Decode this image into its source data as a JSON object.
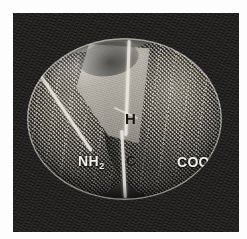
{
  "figure": {
    "kind": "space-filling-molecular-model",
    "background_color": "#201f1e",
    "page_margin_color": "#fdfdfd"
  },
  "labels": {
    "hydrogen": "H",
    "carbon": "C",
    "amino_group": "NH",
    "amino_group_subscript": "2",
    "carboxyl_group": "COOH"
  },
  "regions": {
    "amino_lobe_name": "amino-group-lobe",
    "carboxyl_lobe_name": "carboxyl-group-lobe",
    "hydrogen_wedge_name": "hydrogen-wedge"
  },
  "colors": {
    "plate": "#201f1e",
    "model_light": "#cdc9c1",
    "model_mid": "#8e8a83",
    "model_dark": "#3a3835",
    "ridge": "#ece8e0",
    "label_dark": "#16150f",
    "label_light": "#f3f0e8"
  }
}
